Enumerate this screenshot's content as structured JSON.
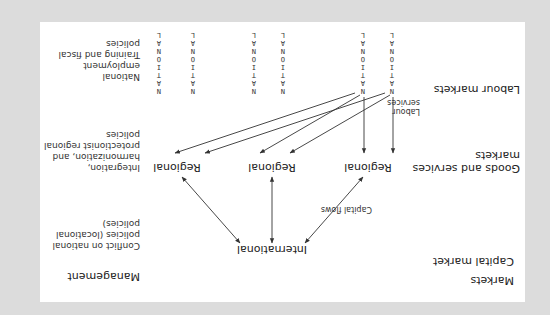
{
  "figure": {
    "orientation": "rotated 180 degrees",
    "colors": {
      "background": "#dcdcdc",
      "panel": "#ffffff",
      "text": "#222222",
      "lines": "#333333"
    },
    "headers": {
      "markets": "Markets",
      "management": "Management"
    },
    "rows": {
      "capital_market": "Capital market",
      "goods_services": [
        "Goods and services",
        "markets"
      ],
      "labour_markets": "Labour markets"
    },
    "nodes": {
      "international": "International",
      "regional_1": "Regional",
      "regional_2": "Regional",
      "regional_3": "Regional",
      "national_label": "NATIONAL",
      "national_count": 6
    },
    "edge_labels": {
      "capital_flows": "Capital flows",
      "labour_services": [
        "Labour",
        "services"
      ]
    },
    "management_notes": {
      "capital": [
        "Conflict on national",
        "policies (locational",
        "policies)"
      ],
      "goods": [
        "Integration,",
        "harmonization, and",
        "protectionist regional",
        "policies"
      ],
      "labour": [
        "National",
        "employment",
        "Training and fiscal",
        "policies"
      ]
    }
  }
}
